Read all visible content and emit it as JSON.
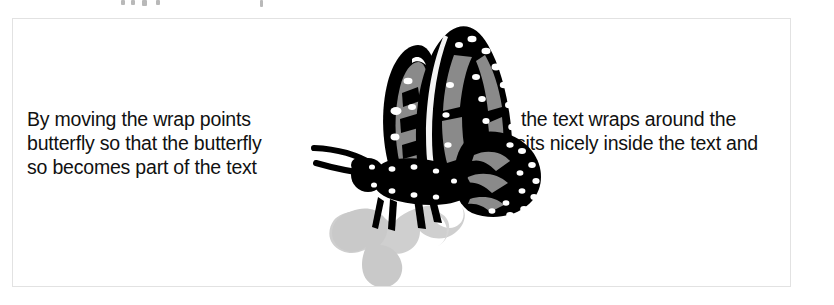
{
  "figure": {
    "caption_above_clipped": "",
    "border_color": "#e2e2e2",
    "background_color": "#ffffff"
  },
  "text_left": {
    "line_1": "By moving the wrap points",
    "line_2": "butterfly so that the butterfly",
    "line_3": "so becomes part of the text"
  },
  "text_right": {
    "line_1": "the text wraps around the",
    "line_2": "sits nicely inside the text and"
  },
  "illustration": {
    "name": "monarch-butterfly-clipart",
    "subject": "butterfly",
    "description": "Side view of a monarch butterfly with raised wings standing on a soft gray cast shadow",
    "colors": {
      "outline": "#000000",
      "wing_panel": "#8a8a8a",
      "wing_spot": "#ffffff",
      "body": "#000000",
      "shadow": "#c6c6c6",
      "shadow_light": "#d6d6d6"
    },
    "parts": [
      "left-forewing",
      "right-forewing",
      "hindwing",
      "thorax",
      "abdomen",
      "head",
      "antenna-upper",
      "antenna-lower",
      "legs",
      "cast-shadow"
    ]
  },
  "text_color": "#111111"
}
